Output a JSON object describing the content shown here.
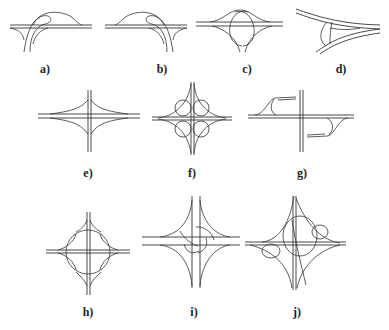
{
  "figure": {
    "panels": [
      {
        "id": "a",
        "label": "a)"
      },
      {
        "id": "b",
        "label": "b)"
      },
      {
        "id": "c",
        "label": "c)"
      },
      {
        "id": "d",
        "label": "d)"
      },
      {
        "id": "e",
        "label": "e)"
      },
      {
        "id": "f",
        "label": "f)"
      },
      {
        "id": "g",
        "label": "g)"
      },
      {
        "id": "h",
        "label": "h)"
      },
      {
        "id": "i",
        "label": "i)"
      },
      {
        "id": "j",
        "label": "j)"
      }
    ]
  },
  "colors": {
    "line": "#333333",
    "background": "#ffffff"
  }
}
